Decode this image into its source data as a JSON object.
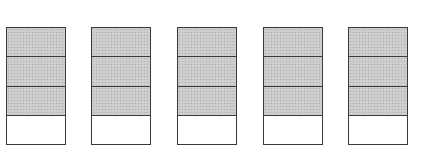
{
  "diagram": {
    "fill_color": "#cbcbcb",
    "border_color": "#3a3a3a",
    "bars": [
      {
        "left": 6,
        "parts": 4,
        "shaded": 3
      },
      {
        "left": 91,
        "parts": 4,
        "shaded": 3
      },
      {
        "left": 177,
        "parts": 4,
        "shaded": 3
      },
      {
        "left": 263,
        "parts": 4,
        "shaded": 3
      },
      {
        "left": 348,
        "parts": 4,
        "shaded": 3
      }
    ]
  }
}
